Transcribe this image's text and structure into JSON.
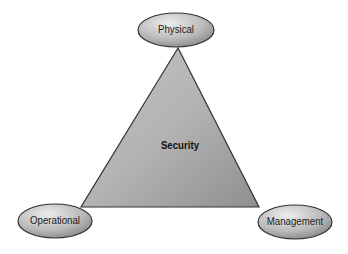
{
  "diagram": {
    "center_label": "Security",
    "nodes": [
      {
        "id": "physical",
        "label": "Physical"
      },
      {
        "id": "operational",
        "label": "Operational"
      },
      {
        "id": "management",
        "label": "Management"
      }
    ],
    "colors": {
      "triangle_fill": "#a9a9a9",
      "stroke": "#333333",
      "ellipse_light": "#e6e6e6",
      "ellipse_dark": "#8c8c8c"
    }
  }
}
